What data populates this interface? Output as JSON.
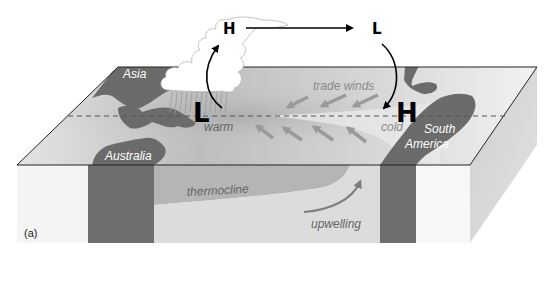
{
  "figure": {
    "panel_label": "(a)"
  },
  "continents": {
    "asia": "Asia",
    "australia": "Australia",
    "south_america": "South America",
    "south_america_line1": "South",
    "south_america_line2": "America"
  },
  "atmosphere": {
    "high_upper_west": "H",
    "low_upper_east": "L",
    "low_surface_west": "L",
    "high_surface_east": "H"
  },
  "ocean_labels": {
    "warm": "warm",
    "cold": "cold",
    "trade_winds": "trade winds",
    "thermocline": "thermocline",
    "upwelling": "upwelling"
  },
  "colors": {
    "land": "#6b6b6b",
    "sea_surface_light": "#e6e6e6",
    "sea_surface_warm": "#b8b8b8",
    "front_face": "#efefef",
    "warm_layer": "#b3b3b3",
    "side_face": "#d2d2d2",
    "cloud": "#ffffff",
    "arrows_wind": "#9a9a9a",
    "circulation_arrow": "#000000"
  }
}
